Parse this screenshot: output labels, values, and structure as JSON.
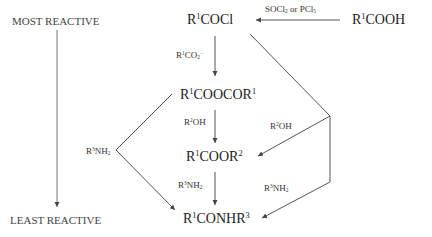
{
  "side_labels": {
    "most": "MOST REACTIVE",
    "least": "LEAST REACTIVE"
  },
  "compounds": {
    "acid_chloride": {
      "base": "R",
      "sup": "1",
      "rest": "COCl"
    },
    "anhydride": {
      "base": "R",
      "sup": "1",
      "rest": "COOCOR",
      "sup2": "1"
    },
    "ester": {
      "base": "R",
      "sup": "1",
      "rest": "COOR",
      "sup2": "2"
    },
    "amide": {
      "base": "R",
      "sup": "1",
      "rest": "CONHR",
      "sup2": "3"
    },
    "acid": {
      "base": "R",
      "sup": "1",
      "rest": "COOH"
    }
  },
  "reagents": {
    "socl2": {
      "a": "SOCl",
      "s1": "2",
      "b": " or PCl",
      "s2": "5"
    },
    "carboxylate": {
      "a": "R",
      "s": "1",
      "b": "CO",
      "sub": "2",
      "c": "−"
    },
    "alcohol_center": {
      "a": "R",
      "s": "2",
      "b": "OH"
    },
    "alcohol_right": {
      "a": "R",
      "s": "2",
      "b": "OH"
    },
    "amine_left": {
      "a": "R",
      "s": "3",
      "b": "NH",
      "sub": "2"
    },
    "amine_center": {
      "a": "R",
      "s": "3",
      "b": "NH",
      "sub": "2"
    },
    "amine_right": {
      "a": "R",
      "s": "3",
      "b": "NH",
      "sub": "2"
    }
  },
  "colors": {
    "line": "#555555",
    "text": "#222222"
  }
}
